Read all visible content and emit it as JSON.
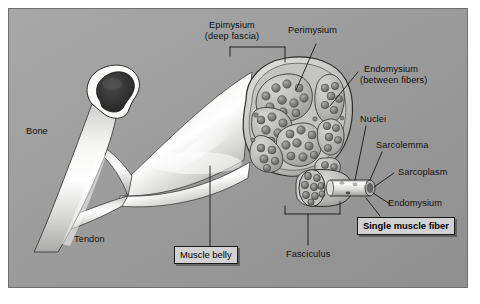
{
  "figure": {
    "panel": {
      "background_color": "#9d9d9d",
      "border_color": "#6f6f6f",
      "page_background": "#ffffff"
    },
    "colors": {
      "bone_cortex": "#f4f4f2",
      "bone_marrow": "#2b2b2b",
      "tendon": "#e9e9e7",
      "muscle_belly": "#d8d8d6",
      "epimysium": "#c9c9c7",
      "fascicle": "#b9b9b7",
      "fiber": "#8e8e8c",
      "leader_line": "#1a1a1a",
      "label_text": "#101010",
      "box_fill": "#d2d2d2"
    }
  },
  "labels": {
    "bone": "Bone",
    "tendon": "Tendon",
    "epimysium_line1": "Epimysium",
    "epimysium_line2": "(deep fascia)",
    "perimysium": "Perimysium",
    "endomysium_top_line1": "Endomysium",
    "endomysium_top_line2": "(between fibers)",
    "nuclei": "Nuclei",
    "sarcolemma": "Sarcolemma",
    "sarcoplasm": "Sarcoplasm",
    "endomysium_right": "Endomysium",
    "fasciculus": "Fasciculus",
    "muscle_belly": "Muscle belly",
    "single_muscle_fiber": "Single muscle fiber"
  },
  "structures": [
    {
      "name": "bone",
      "label": "Bone",
      "description": "Long bone shaft shown in cross-section with white cortical rim and dark marrow cavity"
    },
    {
      "name": "tendon",
      "label": "Tendon",
      "description": "Dense connective tissue cord attaching muscle belly to bone"
    },
    {
      "name": "muscle-belly",
      "label": "Muscle belly",
      "description": "Fleshy contractile portion of the skeletal muscle"
    },
    {
      "name": "epimysium",
      "label": "Epimysium (deep fascia)",
      "description": "Outer connective tissue sheath surrounding the entire muscle"
    },
    {
      "name": "perimysium",
      "label": "Perimysium",
      "description": "Connective tissue surrounding each fasciculus"
    },
    {
      "name": "fasciculus",
      "label": "Fasciculus",
      "description": "Bundle of muscle fibers wrapped by perimysium"
    },
    {
      "name": "endomysium",
      "label": "Endomysium (between fibers)",
      "description": "Delicate connective tissue between individual muscle fibers"
    },
    {
      "name": "single-muscle-fiber",
      "label": "Single muscle fiber",
      "description": "One multinucleated muscle cell"
    },
    {
      "name": "nuclei",
      "label": "Nuclei",
      "description": "Peripheral nuclei beneath the sarcolemma"
    },
    {
      "name": "sarcolemma",
      "label": "Sarcolemma",
      "description": "Plasma membrane of the muscle fiber"
    },
    {
      "name": "sarcoplasm",
      "label": "Sarcoplasm",
      "description": "Cytoplasm of the muscle fiber"
    }
  ],
  "counts": {
    "fascicles_in_cross_section": 7,
    "fibers_in_detail_fascicle": 9
  }
}
